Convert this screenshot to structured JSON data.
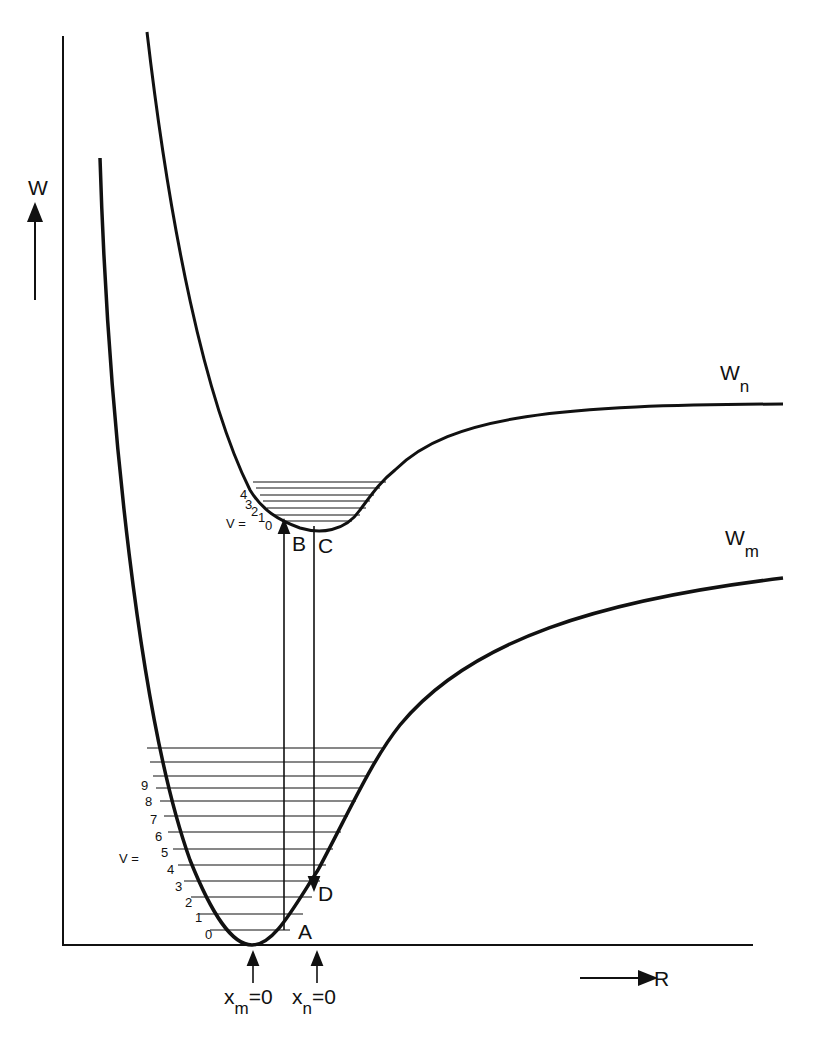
{
  "diagram": {
    "type": "potential-energy-curves",
    "y_axis_label": "W",
    "x_axis_label": "R",
    "curves": [
      {
        "name": "upper",
        "label_main": "W",
        "label_sub": "n"
      },
      {
        "name": "lower",
        "label_main": "W",
        "label_sub": "m"
      }
    ],
    "points": {
      "A": "A",
      "B": "B",
      "C": "C",
      "D": "D"
    },
    "upper_levels": {
      "prefix": "V =",
      "labels": [
        "0",
        "1",
        "2",
        "3",
        "4"
      ]
    },
    "lower_levels": {
      "prefix": "V =",
      "labels": [
        "0",
        "1",
        "2",
        "3",
        "4",
        "5",
        "6",
        "7",
        "8",
        "9"
      ]
    },
    "markers": [
      {
        "main": "x",
        "sub": "m",
        "value": "=0"
      },
      {
        "main": "x",
        "sub": "n",
        "value": "=0"
      }
    ],
    "line_color": "#111111",
    "background": "#ffffff"
  }
}
